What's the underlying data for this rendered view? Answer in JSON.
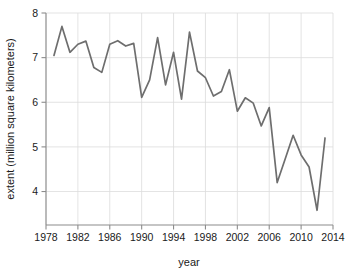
{
  "chart_data": {
    "type": "line",
    "title": "",
    "subtitle": "",
    "xlabel": "year",
    "ylabel": "extent (million square kilometers)",
    "xlim": [
      1978,
      2014
    ],
    "ylim": [
      3.25,
      8.0
    ],
    "xticks": [
      1978,
      1982,
      1986,
      1990,
      1994,
      1998,
      2002,
      2006,
      2010,
      2014
    ],
    "yticks": [
      4,
      5,
      6,
      7,
      8
    ],
    "xtick_labels": [
      "1978",
      "1982",
      "1986",
      "1990",
      "1994",
      "1998",
      "2002",
      "2006",
      "2010",
      "2014"
    ],
    "ytick_labels": [
      "4",
      "5",
      "6",
      "7",
      "8"
    ],
    "grid": true,
    "legend": "none",
    "line_color": "#6e6e6e",
    "grid_color": "#dcdcdc",
    "axis_color": "#8c8c8c",
    "background_color": "#ffffff",
    "x": [
      1979,
      1980,
      1981,
      1982,
      1983,
      1984,
      1985,
      1986,
      1987,
      1988,
      1989,
      1990,
      1991,
      1992,
      1993,
      1994,
      1995,
      1996,
      1997,
      1998,
      1999,
      2000,
      2001,
      2002,
      2003,
      2004,
      2005,
      2006,
      2007,
      2008,
      2009,
      2010,
      2011,
      2012,
      2013
    ],
    "values": [
      7.05,
      7.7,
      7.12,
      7.3,
      7.37,
      6.78,
      6.67,
      7.3,
      7.38,
      7.26,
      7.32,
      6.11,
      6.5,
      7.45,
      6.39,
      7.12,
      6.07,
      7.57,
      6.7,
      6.55,
      6.14,
      6.24,
      6.73,
      5.8,
      6.1,
      5.98,
      5.47,
      5.88,
      4.2,
      4.73,
      5.26,
      4.82,
      4.55,
      3.58,
      5.2
    ],
    "series": [
      {
        "name": "sea ice extent",
        "values": [
          7.05,
          7.7,
          7.12,
          7.3,
          7.37,
          6.78,
          6.67,
          7.3,
          7.38,
          7.26,
          7.32,
          6.11,
          6.5,
          7.45,
          6.39,
          7.12,
          6.07,
          7.57,
          6.7,
          6.55,
          6.14,
          6.24,
          6.73,
          5.8,
          6.1,
          5.98,
          5.47,
          5.88,
          4.2,
          4.73,
          5.26,
          4.82,
          4.55,
          3.58,
          5.2
        ]
      }
    ]
  }
}
